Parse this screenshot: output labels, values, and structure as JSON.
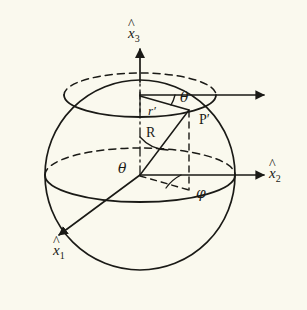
{
  "figure": {
    "background_color": "#faf9ee",
    "ink_color": "#1a1a16"
  },
  "axes": [
    {
      "id": "x3",
      "symbol": "x",
      "hat": "^",
      "subscript": "3",
      "label": "x̂3",
      "direction": "up",
      "description": "vertical polar axis"
    },
    {
      "id": "x2",
      "symbol": "x",
      "hat": "^",
      "subscript": "2",
      "label": "x̂2",
      "direction": "right",
      "description": "horizontal axis to the right"
    },
    {
      "id": "x1",
      "symbol": "x",
      "hat": "^",
      "subscript": "1",
      "label": "x̂1",
      "direction": "down-left",
      "description": "axis toward the viewer, lower left"
    }
  ],
  "labels": {
    "point": "P′",
    "radius": "R",
    "small_radius": "r′",
    "polar_angle_top": "θ",
    "polar_angle_origin": "θ",
    "azimuth_angle": "φ"
  },
  "elements": {
    "sphere": "great circle outline",
    "equator_ellipse": "equatorial circle, back half dashed",
    "latitude_ellipse": "upper latitude circle through P′, back half dashed",
    "radius_line": "R from origin to P′",
    "small_radius_line": "r′ from polar axis to P′",
    "drop_line": "dashed vertical from P′ to equatorial plane",
    "projection_line": "dashed line from origin to projection of P′",
    "upper_arrow": "horizontal arrow at latitude circle level",
    "polar_axis_dashdot": "dash-dot polar axis inside sphere"
  }
}
